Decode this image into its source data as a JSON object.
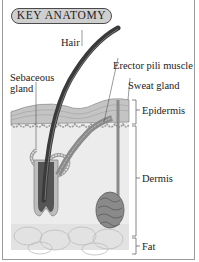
{
  "title": "KEY ANATOMY",
  "labels": {
    "hair": "Hair",
    "erector": "Erector pili muscle",
    "sweat": "Sweat gland",
    "sebaceous_line1": "Sebaceous",
    "sebaceous_line2": "gland",
    "epidermis": "Epidermis",
    "dermis": "Dermis",
    "fat": "Fat"
  },
  "colors": {
    "badge_fill": "#cfcfcf",
    "hair": "#3a3a3a",
    "epidermis": "#c4c4c4",
    "dermis": "#ececec",
    "fat": "#e2e2e2",
    "gland": "#8a8a8a"
  }
}
